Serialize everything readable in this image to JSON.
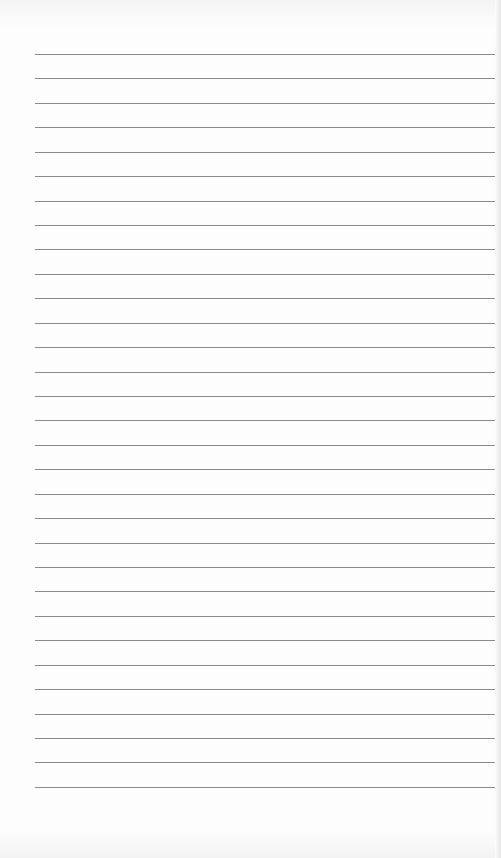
{
  "paper": {
    "type": "lined-paper",
    "line_count": 31,
    "first_line_y": 54,
    "line_spacing": 24.43,
    "line_left": 35,
    "line_color": "#8a8a8a",
    "background_color": "#fdfdfd"
  }
}
